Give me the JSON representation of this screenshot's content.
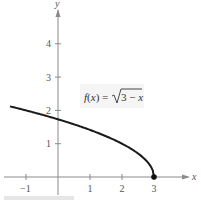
{
  "chart_data": {
    "type": "line",
    "title": "",
    "function_label": "f(x) = √(3 − x)",
    "function_label_parts": {
      "lhs": "f(x) = ",
      "radicand": "3 − x"
    },
    "xlabel": "x",
    "ylabel": "y",
    "xlim": [
      -1.6,
      4.2
    ],
    "ylim": [
      -0.4,
      5.2
    ],
    "x_ticks": [
      -1,
      1,
      2,
      3
    ],
    "y_ticks": [
      1,
      2,
      3,
      4
    ],
    "grid": false,
    "series": [
      {
        "name": "f(x) = sqrt(3 - x)",
        "x": [
          -1.5,
          -1,
          -0.5,
          0,
          0.5,
          1,
          1.5,
          2,
          2.5,
          2.75,
          2.9,
          2.97,
          3
        ],
        "y": [
          2.12,
          2.0,
          1.87,
          1.73,
          1.58,
          1.41,
          1.22,
          1.0,
          0.71,
          0.5,
          0.32,
          0.17,
          0
        ]
      }
    ],
    "annotations": [
      {
        "type": "point",
        "x": 3,
        "y": 0,
        "style": "filled-dot"
      }
    ],
    "axis_style": {
      "color": "#888888",
      "curve_color": "#1a1a1a"
    }
  }
}
